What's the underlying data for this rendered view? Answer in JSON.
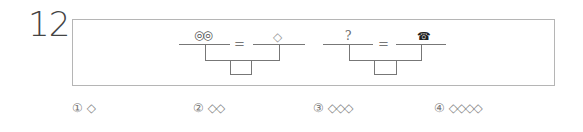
{
  "question": {
    "number": "12",
    "equation_left": {
      "top_symbol": "◎◎",
      "equals": "=",
      "right_symbol": "◇"
    },
    "equation_right": {
      "top_symbol": "?",
      "equals": "=",
      "right_symbol": "☎"
    }
  },
  "options": [
    {
      "marker": "①",
      "value": "◇"
    },
    {
      "marker": "②",
      "value": "◇◇"
    },
    {
      "marker": "③",
      "value": "◇◇◇"
    },
    {
      "marker": "④",
      "value": "◇◇◇◇"
    }
  ]
}
